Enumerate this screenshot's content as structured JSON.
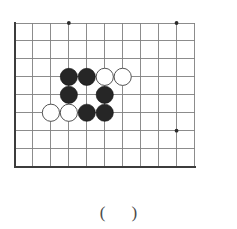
{
  "diagram": {
    "kind": "go-board-problem",
    "board": {
      "origin_x": 15,
      "origin_y": 23,
      "cell": 17.95,
      "cols": 11,
      "rows": 9,
      "line_color": "#808080",
      "border_color": "#3c3c3c",
      "border_width": 2.1,
      "line_width": 0.9,
      "star_color": "#2b2b2b",
      "star_radius": 1.9,
      "star_points": [
        {
          "col": 3,
          "row": 0
        },
        {
          "col": 9,
          "row": 0
        },
        {
          "col": 9,
          "row": 6
        }
      ]
    },
    "stones": {
      "radius": 8.6,
      "black_fill": "#262626",
      "black_stroke": "#111111",
      "white_fill": "#ffffff",
      "white_stroke": "#545454",
      "items": [
        {
          "color": "black",
          "col": 3,
          "row": 3,
          "label": "black-stone"
        },
        {
          "color": "black",
          "col": 4,
          "row": 3,
          "label": "black-stone"
        },
        {
          "color": "white",
          "col": 5,
          "row": 3,
          "label": "white-stone"
        },
        {
          "color": "white",
          "col": 6,
          "row": 3,
          "label": "white-stone"
        },
        {
          "color": "black",
          "col": 3,
          "row": 4,
          "label": "black-stone"
        },
        {
          "color": "black",
          "col": 5,
          "row": 4,
          "label": "black-stone"
        },
        {
          "color": "white",
          "col": 2,
          "row": 5,
          "label": "white-stone"
        },
        {
          "color": "white",
          "col": 3,
          "row": 5,
          "label": "white-stone"
        },
        {
          "color": "black",
          "col": 4,
          "row": 5,
          "label": "black-stone"
        },
        {
          "color": "black",
          "col": 5,
          "row": 5,
          "label": "black-stone"
        }
      ]
    }
  },
  "answer": {
    "open_paren": "(",
    "close_paren": ")",
    "value": ""
  }
}
